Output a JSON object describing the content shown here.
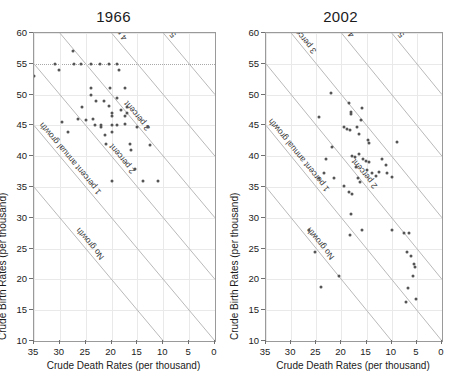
{
  "figure": {
    "x_axis_title": "Crude Death Rates (per thousand)",
    "y_axis_title": "Crude Birth Rates (per thousand)"
  },
  "chart_data": [
    {
      "type": "scatter",
      "title": "1966",
      "xlabel": "Crude Death Rates (per thousand)",
      "ylabel": "Crude Birth Rates (per thousand)",
      "xlim": [
        35,
        0
      ],
      "ylim": [
        10,
        60
      ],
      "x_reversed": true,
      "grid": true,
      "legend": "none",
      "xticks": [
        35,
        30,
        25,
        20,
        15,
        10,
        5,
        0
      ],
      "yticks": [
        10,
        15,
        20,
        25,
        30,
        35,
        40,
        45,
        50,
        55,
        60
      ],
      "highlight_gridline_y": 55,
      "annotations": [
        {
          "label": "No growth",
          "growth_percent": 0
        },
        {
          "label": "1 percent annual growth",
          "growth_percent": 1
        },
        {
          "label": "2 percent",
          "growth_percent": 2
        },
        {
          "label": "3 percent",
          "growth_percent": 3
        },
        {
          "label": "4 percent",
          "growth_percent": 4
        },
        {
          "label": "5 percent",
          "growth_percent": 5
        }
      ],
      "points": [
        [
          35.0,
          53.0
        ],
        [
          31.0,
          55.0
        ],
        [
          30.2,
          54.0
        ],
        [
          27.5,
          57.0
        ],
        [
          27.2,
          55.0
        ],
        [
          26.0,
          55.0
        ],
        [
          25.8,
          48.0
        ],
        [
          24.0,
          55.0
        ],
        [
          24.0,
          51.0
        ],
        [
          24.0,
          50.0
        ],
        [
          23.5,
          46.0
        ],
        [
          23.0,
          49.0
        ],
        [
          22.2,
          55.0
        ],
        [
          22.0,
          45.0
        ],
        [
          22.0,
          44.8
        ],
        [
          21.5,
          49.0
        ],
        [
          21.2,
          43.5
        ],
        [
          21.0,
          42.0
        ],
        [
          20.5,
          55.0
        ],
        [
          20.5,
          48.2
        ],
        [
          20.3,
          51.0
        ],
        [
          20.0,
          47.0
        ],
        [
          20.0,
          46.5
        ],
        [
          20.0,
          45.0
        ],
        [
          20.0,
          44.0
        ],
        [
          20.0,
          36.0
        ],
        [
          19.0,
          55.0
        ],
        [
          19.0,
          49.5
        ],
        [
          19.0,
          45.0
        ],
        [
          18.5,
          54.0
        ],
        [
          18.2,
          47.5
        ],
        [
          17.5,
          51.0
        ],
        [
          17.5,
          46.5
        ],
        [
          17.5,
          45.2
        ],
        [
          17.0,
          48.0
        ],
        [
          17.0,
          47.0
        ],
        [
          16.5,
          42.0
        ],
        [
          16.2,
          41.0
        ],
        [
          15.5,
          38.0
        ],
        [
          15.0,
          44.8
        ],
        [
          14.0,
          36.0
        ],
        [
          13.0,
          44.8
        ],
        [
          12.5,
          41.8
        ],
        [
          11.0,
          36.0
        ],
        [
          29.5,
          45.5
        ],
        [
          28.5,
          44.0
        ],
        [
          26.5,
          46.0
        ],
        [
          25.0,
          45.8
        ],
        [
          23.2,
          45.0
        ]
      ]
    },
    {
      "type": "scatter",
      "title": "2002",
      "xlabel": "Crude Death Rates (per thousand)",
      "ylabel": "Crude Birth Rates (per thousand)",
      "xlim": [
        35,
        0
      ],
      "ylim": [
        10,
        60
      ],
      "x_reversed": true,
      "grid": true,
      "legend": "none",
      "xticks": [
        35,
        30,
        25,
        20,
        15,
        10,
        5,
        0
      ],
      "yticks": [
        10,
        15,
        20,
        25,
        30,
        35,
        40,
        45,
        50,
        55,
        60
      ],
      "annotations": [
        {
          "label": "No growth",
          "growth_percent": 0
        },
        {
          "label": "1 percent annual growth",
          "growth_percent": 1
        },
        {
          "label": "2 percent",
          "growth_percent": 2
        },
        {
          "label": "3 percent",
          "growth_percent": 3
        },
        {
          "label": "4 percent",
          "growth_percent": 4
        },
        {
          "label": "5 percent",
          "growth_percent": 5
        }
      ],
      "points": [
        [
          22.0,
          50.2
        ],
        [
          24.5,
          46.4
        ],
        [
          18.5,
          48.6
        ],
        [
          18.0,
          47.2
        ],
        [
          18.0,
          46.8
        ],
        [
          16.0,
          47.8
        ],
        [
          16.2,
          45.8
        ],
        [
          19.5,
          44.8
        ],
        [
          18.8,
          44.4
        ],
        [
          18.2,
          44.3
        ],
        [
          17.0,
          44.8
        ],
        [
          16.5,
          43.6
        ],
        [
          14.8,
          42.6
        ],
        [
          14.6,
          42.2
        ],
        [
          9.0,
          42.3
        ],
        [
          21.8,
          41.5
        ],
        [
          23.0,
          39.5
        ],
        [
          17.8,
          40.0
        ],
        [
          17.4,
          39.8
        ],
        [
          16.5,
          40.3
        ],
        [
          15.8,
          39.5
        ],
        [
          15.2,
          39.2
        ],
        [
          14.6,
          39.0
        ],
        [
          12.0,
          39.5
        ],
        [
          11.2,
          38.6
        ],
        [
          24.5,
          36.4
        ],
        [
          23.5,
          37.2
        ],
        [
          21.5,
          36.5
        ],
        [
          19.5,
          35.2
        ],
        [
          17.2,
          38.2
        ],
        [
          16.8,
          36.5
        ],
        [
          16.4,
          35.8
        ],
        [
          15.0,
          37.8
        ],
        [
          14.0,
          37.2
        ],
        [
          13.2,
          36.8
        ],
        [
          12.5,
          37.4
        ],
        [
          11.0,
          37.3
        ],
        [
          10.0,
          36.6
        ],
        [
          18.5,
          34.2
        ],
        [
          17.8,
          33.8
        ],
        [
          18.0,
          30.6
        ],
        [
          18.2,
          27.2
        ],
        [
          26.5,
          28.0
        ],
        [
          16.0,
          28.0
        ],
        [
          10.0,
          28.0
        ],
        [
          6.5,
          27.5
        ],
        [
          7.5,
          27.6
        ],
        [
          25.2,
          24.5
        ],
        [
          7.0,
          24.5
        ],
        [
          6.2,
          23.8
        ],
        [
          5.5,
          22.5
        ],
        [
          5.4,
          22.0
        ],
        [
          20.5,
          20.6
        ],
        [
          5.8,
          20.5
        ],
        [
          24.0,
          18.8
        ],
        [
          6.8,
          18.6
        ],
        [
          7.2,
          16.4
        ],
        [
          5.2,
          16.8
        ]
      ]
    }
  ]
}
